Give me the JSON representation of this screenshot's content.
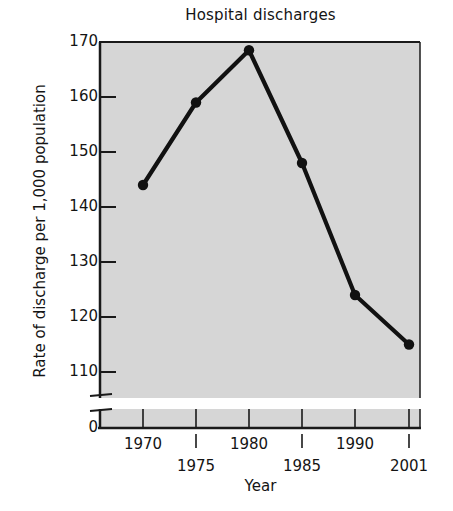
{
  "chart_data": {
    "type": "line",
    "title": "Hospital discharges",
    "xlabel": "Year",
    "ylabel": "Rate of discharge per 1,000 population",
    "x": [
      1970,
      1975,
      1980,
      1985,
      1990,
      2001
    ],
    "xtick_labels": [
      "1970",
      "1975",
      "1980",
      "1985",
      "1990",
      "2001"
    ],
    "values": [
      144,
      159,
      168.5,
      148,
      124,
      115
    ],
    "series": [
      {
        "name": "Hospital discharges",
        "values": [
          144,
          159,
          168.5,
          148,
          124,
          115
        ]
      }
    ],
    "ytick_labels": [
      "170",
      "160",
      "150",
      "140",
      "130",
      "120",
      "110",
      "0"
    ],
    "ytick_values": [
      170,
      160,
      150,
      140,
      130,
      120,
      110,
      0
    ],
    "ylim": [
      108,
      170
    ],
    "axis_break": true,
    "axis_break_label": "0",
    "grid": false,
    "legend": "none",
    "marker": "filled-circle",
    "line_color": "#111111",
    "marker_color": "#111111",
    "plot_background": "#d6d6d6",
    "figure_background": "#ffffff"
  }
}
